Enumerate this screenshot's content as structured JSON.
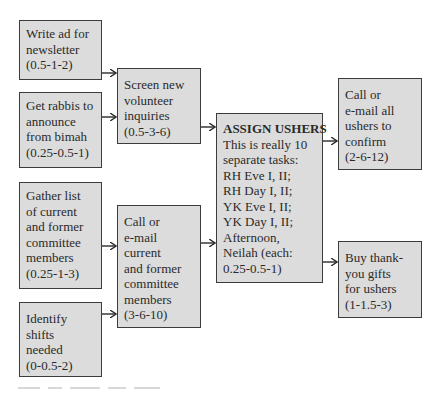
{
  "diagram": {
    "type": "flowchart",
    "estimate_format": "(optimistic-likely-pessimistic)",
    "colors": {
      "box_fill": "#dcdcdc",
      "box_border": "#3c3c3c",
      "text": "#2a2a2a",
      "arrow": "#2a2a2a",
      "background": "#ffffff"
    },
    "nodes": [
      {
        "id": "write_ad",
        "lines": [
          "Write ad for",
          "newsletter",
          "(0.5-1-2)"
        ],
        "task": "Write ad for newsletter",
        "estimate": "0.5-1-2"
      },
      {
        "id": "get_rabbis",
        "lines": [
          "Get rabbis to",
          "announce",
          "from bimah",
          "(0.25-0.5-1)"
        ],
        "task": "Get rabbis to announce from bimah",
        "estimate": "0.25-0.5-1"
      },
      {
        "id": "gather_list",
        "lines": [
          "Gather list",
          "of current",
          "and former",
          "committee",
          "members",
          "(0.25-1-3)"
        ],
        "task": "Gather list of current and former committee members",
        "estimate": "0.25-1-3"
      },
      {
        "id": "identify_shifts",
        "lines": [
          "Identify",
          "shifts",
          "needed",
          "(0-0.5-2)"
        ],
        "task": "Identify shifts needed",
        "estimate": "0-0.5-2"
      },
      {
        "id": "screen_volunteers",
        "lines": [
          "Screen new",
          "volunteer",
          "inquiries",
          "(0.5-3-6)"
        ],
        "task": "Screen new volunteer inquiries",
        "estimate": "0.5-3-6"
      },
      {
        "id": "call_committee",
        "lines": [
          "Call or",
          "e-mail",
          "current",
          "and former",
          "committee",
          "members",
          "(3-6-10)"
        ],
        "task": "Call or e-mail current and former committee members",
        "estimate": "3-6-10"
      },
      {
        "id": "assign_ushers",
        "title": "ASSIGN USHERS",
        "lines": [
          "This is really 10",
          "separate tasks:",
          "RH Eve I, II;",
          "RH Day I, II;",
          "YK Eve I, II;",
          "YK Day I, II;",
          "Afternoon,",
          "Neilah (each:",
          "0.25-0.5-1)"
        ],
        "task": "Assign ushers",
        "estimate": "0.25-0.5-1 each"
      },
      {
        "id": "confirm_ushers",
        "lines": [
          "Call or",
          "e-mail all",
          "ushers to",
          "confirm",
          "(2-6-12)"
        ],
        "task": "Call or e-mail all ushers to confirm",
        "estimate": "2-6-12"
      },
      {
        "id": "buy_gifts",
        "lines": [
          "Buy thank-",
          "you gifts",
          "for ushers",
          "(1-1.5-3)"
        ],
        "task": "Buy thank-you gifts for ushers",
        "estimate": "1-1.5-3"
      }
    ],
    "edges": [
      {
        "from": "write_ad",
        "to": "screen_volunteers"
      },
      {
        "from": "get_rabbis",
        "to": "screen_volunteers"
      },
      {
        "from": "gather_list",
        "to": "call_committee"
      },
      {
        "from": "identify_shifts",
        "to": "call_committee"
      },
      {
        "from": "screen_volunteers",
        "to": "assign_ushers"
      },
      {
        "from": "call_committee",
        "to": "assign_ushers"
      },
      {
        "from": "assign_ushers",
        "to": "confirm_ushers"
      },
      {
        "from": "assign_ushers",
        "to": "buy_gifts"
      }
    ]
  }
}
